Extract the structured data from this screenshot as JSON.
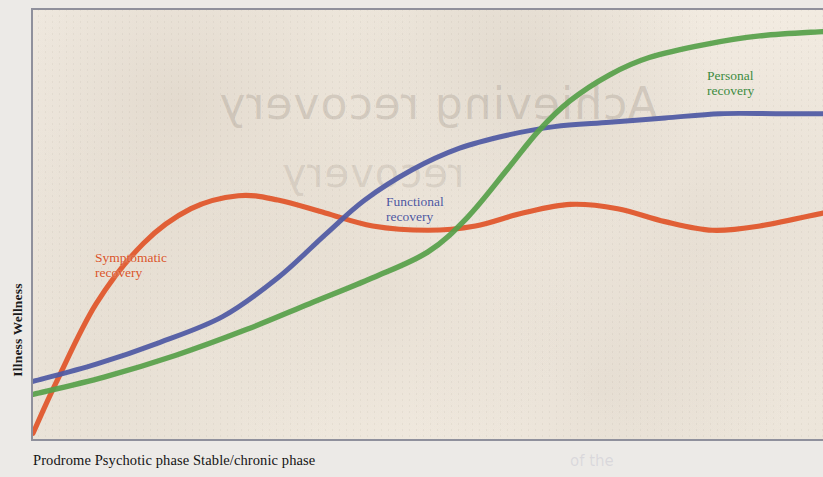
{
  "figure": {
    "background_color": "#eceae7",
    "plot_background_color": "#f2ece2",
    "frame_color": "#8f909c"
  },
  "axes": {
    "y_title": "Illness Wellness",
    "x_title": "Prodrome Psychotic phase Stable/chronic phase"
  },
  "artifacts": {
    "bleed_through_text": "Achieving recovery",
    "bleed_through_text_2": "recovery",
    "caption_bleed_text": "of the"
  },
  "chart_data": {
    "type": "line",
    "title": "",
    "subtitle": "",
    "xlabel": "Prodrome Psychotic phase Stable/chronic phase",
    "ylabel": "Illness Wellness",
    "xlim": [
      0,
      100
    ],
    "ylim": [
      0,
      100
    ],
    "grid": false,
    "legend_position": "inline-curve-labels",
    "x_tick_labels": [
      "Prodrome",
      "Psychotic phase",
      "Stable/chronic phase"
    ],
    "y_tick_labels": [
      "Illness",
      "Wellness"
    ],
    "annotations": [
      {
        "text": "Symptomatic recovery",
        "series": "Symptomatic recovery",
        "x": 5,
        "y": 47
      },
      {
        "text": "Functional recovery",
        "series": "Functional recovery",
        "x": 42,
        "y": 60
      },
      {
        "text": "Personal recovery",
        "series": "Personal recovery",
        "x": 82,
        "y": 90
      }
    ],
    "series": [
      {
        "name": "Symptomatic recovery",
        "color": "#e0552a",
        "label_line1": "Symptomatic",
        "label_line2": "recovery",
        "x": [
          0,
          3,
          8,
          14,
          20,
          26,
          31,
          37,
          43,
          50,
          56,
          62,
          68,
          74,
          80,
          86,
          92,
          100
        ],
        "y": [
          2,
          14,
          32,
          46,
          54,
          57,
          56,
          53,
          50,
          49,
          50,
          53,
          55,
          54,
          51,
          49,
          50,
          53
        ]
      },
      {
        "name": "Functional recovery",
        "color": "#4f59a4",
        "label_line1": "Functional",
        "label_line2": "recovery",
        "x": [
          0,
          8,
          16,
          24,
          31,
          37,
          42,
          48,
          54,
          60,
          66,
          73,
          80,
          87,
          94,
          100
        ],
        "y": [
          14,
          18,
          23,
          29,
          38,
          48,
          56,
          63,
          68,
          71,
          73,
          74,
          75,
          76,
          76,
          76
        ]
      },
      {
        "name": "Personal recovery",
        "color": "#57a04a",
        "label_line1": "Personal",
        "label_line2": "recovery",
        "x": [
          0,
          9,
          18,
          27,
          35,
          43,
          50,
          55,
          60,
          64,
          68,
          73,
          78,
          85,
          92,
          100
        ],
        "y": [
          11,
          15,
          20,
          26,
          32,
          38,
          44,
          52,
          63,
          72,
          79,
          85,
          89,
          92,
          94,
          95
        ]
      }
    ]
  }
}
